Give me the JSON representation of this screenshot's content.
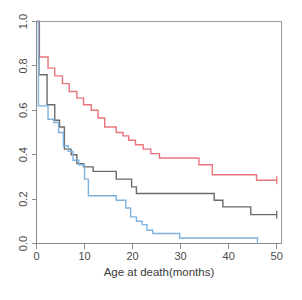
{
  "chart_data": {
    "type": "line",
    "plot_style": "kaplan-meier-step",
    "title": "",
    "subtitle": "",
    "xlabel": "Age at death(months)",
    "ylabel": "",
    "xlim": [
      0,
      51
    ],
    "ylim": [
      0,
      1.0
    ],
    "grid": false,
    "legend": "none",
    "xticks": [
      0,
      10,
      20,
      30,
      40,
      50
    ],
    "xtick_labels": [
      "0",
      "10",
      "20",
      "30",
      "40",
      "50"
    ],
    "yticks": [
      0.0,
      0.2,
      0.4,
      0.6,
      0.8,
      1.0
    ],
    "ytick_labels": [
      "0.0",
      "0.2",
      "0.4",
      "0.6",
      "0.8",
      "1.0"
    ],
    "ytick_label_rotation": -90,
    "colors": {
      "red_curve": "#e8747c",
      "gray_curve": "#6b6b6b",
      "blue_curve": "#7fb3dd",
      "axis": "#8a8a8a",
      "background": "#ffffff"
    },
    "series": [
      {
        "name": "red_curve",
        "color": "#e8747c",
        "points": [
          [
            0,
            1.0
          ],
          [
            0.6,
            0.84
          ],
          [
            2.2,
            0.84
          ],
          [
            2.4,
            0.79
          ],
          [
            3.6,
            0.79
          ],
          [
            3.8,
            0.755
          ],
          [
            5.2,
            0.755
          ],
          [
            5.4,
            0.72
          ],
          [
            6.6,
            0.72
          ],
          [
            6.8,
            0.685
          ],
          [
            8.2,
            0.685
          ],
          [
            8.4,
            0.655
          ],
          [
            9.6,
            0.655
          ],
          [
            9.8,
            0.625
          ],
          [
            11.2,
            0.625
          ],
          [
            11.4,
            0.6
          ],
          [
            12.6,
            0.6
          ],
          [
            12.8,
            0.565
          ],
          [
            14.0,
            0.565
          ],
          [
            14.2,
            0.525
          ],
          [
            16.4,
            0.525
          ],
          [
            16.6,
            0.5
          ],
          [
            17.8,
            0.5
          ],
          [
            18.0,
            0.485
          ],
          [
            19.0,
            0.485
          ],
          [
            19.2,
            0.465
          ],
          [
            20.4,
            0.465
          ],
          [
            20.6,
            0.445
          ],
          [
            22.0,
            0.445
          ],
          [
            22.2,
            0.425
          ],
          [
            23.6,
            0.425
          ],
          [
            23.8,
            0.405
          ],
          [
            25.4,
            0.405
          ],
          [
            25.6,
            0.385
          ],
          [
            33.6,
            0.385
          ],
          [
            33.8,
            0.355
          ],
          [
            36.4,
            0.355
          ],
          [
            36.6,
            0.31
          ],
          [
            45.6,
            0.31
          ],
          [
            45.8,
            0.285
          ],
          [
            50.0,
            0.285
          ]
        ],
        "censored": [
          [
            50.0,
            0.285
          ]
        ],
        "end_value": 0.285
      },
      {
        "name": "gray_curve",
        "color": "#6b6b6b",
        "points": [
          [
            0,
            1.0
          ],
          [
            0.5,
            0.76
          ],
          [
            2.0,
            0.76
          ],
          [
            2.2,
            0.625
          ],
          [
            3.6,
            0.625
          ],
          [
            3.8,
            0.555
          ],
          [
            4.6,
            0.555
          ],
          [
            4.8,
            0.525
          ],
          [
            5.6,
            0.525
          ],
          [
            5.8,
            0.425
          ],
          [
            7.0,
            0.425
          ],
          [
            7.2,
            0.4
          ],
          [
            8.2,
            0.4
          ],
          [
            8.4,
            0.36
          ],
          [
            9.6,
            0.36
          ],
          [
            9.8,
            0.345
          ],
          [
            11.6,
            0.345
          ],
          [
            11.8,
            0.325
          ],
          [
            16.4,
            0.325
          ],
          [
            16.6,
            0.29
          ],
          [
            19.6,
            0.29
          ],
          [
            19.8,
            0.255
          ],
          [
            20.6,
            0.255
          ],
          [
            20.8,
            0.225
          ],
          [
            36.8,
            0.225
          ],
          [
            37.0,
            0.195
          ],
          [
            38.6,
            0.195
          ],
          [
            38.8,
            0.165
          ],
          [
            44.4,
            0.165
          ],
          [
            44.6,
            0.13
          ],
          [
            50.0,
            0.13
          ]
        ],
        "censored": [
          [
            50.0,
            0.13
          ]
        ],
        "end_value": 0.13
      },
      {
        "name": "blue_curve",
        "color": "#7fb3dd",
        "points": [
          [
            0,
            1.0
          ],
          [
            0.4,
            0.62
          ],
          [
            2.2,
            0.62
          ],
          [
            2.4,
            0.56
          ],
          [
            3.4,
            0.56
          ],
          [
            3.6,
            0.545
          ],
          [
            4.4,
            0.545
          ],
          [
            4.6,
            0.5
          ],
          [
            5.4,
            0.5
          ],
          [
            5.6,
            0.44
          ],
          [
            6.4,
            0.44
          ],
          [
            6.6,
            0.415
          ],
          [
            7.4,
            0.415
          ],
          [
            7.6,
            0.375
          ],
          [
            8.6,
            0.375
          ],
          [
            8.8,
            0.355
          ],
          [
            9.8,
            0.355
          ],
          [
            10.0,
            0.29
          ],
          [
            10.6,
            0.29
          ],
          [
            10.8,
            0.215
          ],
          [
            16.4,
            0.215
          ],
          [
            16.6,
            0.195
          ],
          [
            18.4,
            0.195
          ],
          [
            18.6,
            0.16
          ],
          [
            19.4,
            0.16
          ],
          [
            19.6,
            0.12
          ],
          [
            20.6,
            0.12
          ],
          [
            20.8,
            0.1
          ],
          [
            21.8,
            0.1
          ],
          [
            22.0,
            0.085
          ],
          [
            22.8,
            0.085
          ],
          [
            23.0,
            0.06
          ],
          [
            24.0,
            0.06
          ],
          [
            24.2,
            0.045
          ],
          [
            29.6,
            0.045
          ],
          [
            29.8,
            0.025
          ],
          [
            46.0,
            0.025
          ],
          [
            46.0,
            0.0
          ]
        ],
        "censored": [],
        "end_value": 0.025
      }
    ],
    "annotations": []
  },
  "axes": {
    "x_axis_title": "Age at death(months)",
    "y_axis_title": ""
  },
  "footer": {
    "ghost_text": ""
  }
}
